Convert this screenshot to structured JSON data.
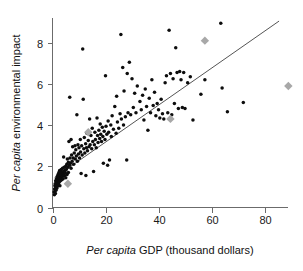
{
  "chart_data": {
    "type": "scatter",
    "title": "",
    "xlabel_italic": "Per capita",
    "xlabel_rest": " GDP (thousand dollars)",
    "ylabel_italic": "Per capita",
    "ylabel_rest": " environmental impact",
    "xlim": [
      0,
      92
    ],
    "ylim": [
      0,
      9.2
    ],
    "xticks": [
      0,
      20,
      40,
      60,
      80
    ],
    "xticklabels": [
      "0",
      "20",
      "40",
      "60",
      "80"
    ],
    "yticks": [
      0,
      2,
      4,
      6,
      8
    ],
    "yticklabels": [
      "0",
      "2",
      "4",
      "6",
      "8"
    ],
    "grid": false,
    "legend": "none",
    "series": [
      {
        "name": "countries",
        "marker": "circle",
        "color": "#0d0d0d",
        "points": [
          [
            0.6,
            0.75
          ],
          [
            0.7,
            0.62
          ],
          [
            0.8,
            0.9
          ],
          [
            0.9,
            1.05
          ],
          [
            1.0,
            0.8
          ],
          [
            1.0,
            1.15
          ],
          [
            1.1,
            0.68
          ],
          [
            1.2,
            1.3
          ],
          [
            1.2,
            0.95
          ],
          [
            1.3,
            1.1
          ],
          [
            1.4,
            1.25
          ],
          [
            1.4,
            0.85
          ],
          [
            1.5,
            1.4
          ],
          [
            1.5,
            1.0
          ],
          [
            1.6,
            1.2
          ],
          [
            1.7,
            1.35
          ],
          [
            1.7,
            0.95
          ],
          [
            1.8,
            1.5
          ],
          [
            1.8,
            1.1
          ],
          [
            1.9,
            1.25
          ],
          [
            2.0,
            1.45
          ],
          [
            2.0,
            1.05
          ],
          [
            2.1,
            1.6
          ],
          [
            2.1,
            1.2
          ],
          [
            2.2,
            1.35
          ],
          [
            2.3,
            1.5
          ],
          [
            2.3,
            1.15
          ],
          [
            2.4,
            1.7
          ],
          [
            2.4,
            1.3
          ],
          [
            2.5,
            1.45
          ],
          [
            2.6,
            1.6
          ],
          [
            2.6,
            1.25
          ],
          [
            2.7,
            1.8
          ],
          [
            2.8,
            1.4
          ],
          [
            2.8,
            1.05
          ],
          [
            2.9,
            1.55
          ],
          [
            3.0,
            1.75
          ],
          [
            3.0,
            1.3
          ],
          [
            3.1,
            1.6
          ],
          [
            3.2,
            1.45
          ],
          [
            3.3,
            1.85
          ],
          [
            3.4,
            1.55
          ],
          [
            3.5,
            1.35
          ],
          [
            3.6,
            1.7
          ],
          [
            3.7,
            1.5
          ],
          [
            3.8,
            1.9
          ],
          [
            3.9,
            1.6
          ],
          [
            4.0,
            1.4
          ],
          [
            4.1,
            1.75
          ],
          [
            4.2,
            2.45
          ],
          [
            4.3,
            1.65
          ],
          [
            4.4,
            1.95
          ],
          [
            4.5,
            1.55
          ],
          [
            4.6,
            1.8
          ],
          [
            4.8,
            1.7
          ],
          [
            5.0,
            2.0
          ],
          [
            5.0,
            1.45
          ],
          [
            5.2,
            1.85
          ],
          [
            5.4,
            2.1
          ],
          [
            5.5,
            1.6
          ],
          [
            5.6,
            2.35
          ],
          [
            5.8,
            1.95
          ],
          [
            6.0,
            2.2
          ],
          [
            6.0,
            1.7
          ],
          [
            6.2,
            3.2
          ],
          [
            6.4,
            2.05
          ],
          [
            6.5,
            5.35
          ],
          [
            6.6,
            2.4
          ],
          [
            6.8,
            2.15
          ],
          [
            7.0,
            3.3
          ],
          [
            7.0,
            1.9
          ],
          [
            7.2,
            2.55
          ],
          [
            7.4,
            2.25
          ],
          [
            7.6,
            2.95
          ],
          [
            7.8,
            2.4
          ],
          [
            8.0,
            2.1
          ],
          [
            8.2,
            2.65
          ],
          [
            8.5,
            3.0
          ],
          [
            8.6,
            2.35
          ],
          [
            8.8,
            2.8
          ],
          [
            9.0,
            2.5
          ],
          [
            9.2,
            4.5
          ],
          [
            9.4,
            2.25
          ],
          [
            9.6,
            3.05
          ],
          [
            9.8,
            2.6
          ],
          [
            10.0,
            2.9
          ],
          [
            10.2,
            2.4
          ],
          [
            10.5,
            3.3
          ],
          [
            10.6,
            2.7
          ],
          [
            10.8,
            1.65
          ],
          [
            11.0,
            3.0
          ],
          [
            11.2,
            2.55
          ],
          [
            11.4,
            7.7
          ],
          [
            11.6,
            5.25
          ],
          [
            11.8,
            2.85
          ],
          [
            12.0,
            3.4
          ],
          [
            12.2,
            2.65
          ],
          [
            12.5,
            3.1
          ],
          [
            12.6,
            1.55
          ],
          [
            12.8,
            2.9
          ],
          [
            13.0,
            3.6
          ],
          [
            13.2,
            2.75
          ],
          [
            13.5,
            3.25
          ],
          [
            13.8,
            2.95
          ],
          [
            14.0,
            4.3
          ],
          [
            14.2,
            3.05
          ],
          [
            14.5,
            3.5
          ],
          [
            14.8,
            2.85
          ],
          [
            15.0,
            3.85
          ],
          [
            15.2,
            3.2
          ],
          [
            15.5,
            1.75
          ],
          [
            15.8,
            3.05
          ],
          [
            16.0,
            3.65
          ],
          [
            16.2,
            3.3
          ],
          [
            16.5,
            2.9
          ],
          [
            16.8,
            4.35
          ],
          [
            17.0,
            3.5
          ],
          [
            17.2,
            3.15
          ],
          [
            17.5,
            3.75
          ],
          [
            17.8,
            3.35
          ],
          [
            18.0,
            4.05
          ],
          [
            18.2,
            3.55
          ],
          [
            18.5,
            3.2
          ],
          [
            18.8,
            3.9
          ],
          [
            19.0,
            3.45
          ],
          [
            19.2,
            2.15
          ],
          [
            19.5,
            3.7
          ],
          [
            19.8,
            3.3
          ],
          [
            20.0,
            6.4
          ],
          [
            20.2,
            3.95
          ],
          [
            20.5,
            3.55
          ],
          [
            20.8,
            2.05
          ],
          [
            21.0,
            4.2
          ],
          [
            21.2,
            3.65
          ],
          [
            21.5,
            2.3
          ],
          [
            22.0,
            4.0
          ],
          [
            22.2,
            3.45
          ],
          [
            22.5,
            4.45
          ],
          [
            23.0,
            3.8
          ],
          [
            23.5,
            4.9
          ],
          [
            24.0,
            3.6
          ],
          [
            24.2,
            5.4
          ],
          [
            24.5,
            4.15
          ],
          [
            25.0,
            3.85
          ],
          [
            25.5,
            4.55
          ],
          [
            25.8,
            8.4
          ],
          [
            26.0,
            4.3
          ],
          [
            26.5,
            6.8
          ],
          [
            26.8,
            4.0
          ],
          [
            27.0,
            5.65
          ],
          [
            27.5,
            4.4
          ],
          [
            28.0,
            2.3
          ],
          [
            28.2,
            6.5
          ],
          [
            28.5,
            4.6
          ],
          [
            29.0,
            7.05
          ],
          [
            29.5,
            4.5
          ],
          [
            30.0,
            6.25
          ],
          [
            30.5,
            4.85
          ],
          [
            31.0,
            5.55
          ],
          [
            31.5,
            4.6
          ],
          [
            32.0,
            5.9
          ],
          [
            33.0,
            5.15
          ],
          [
            33.5,
            4.75
          ],
          [
            34.0,
            5.45
          ],
          [
            34.5,
            4.25
          ],
          [
            35.0,
            5.75
          ],
          [
            35.5,
            4.9
          ],
          [
            36.0,
            3.75
          ],
          [
            36.5,
            5.3
          ],
          [
            37.0,
            4.6
          ],
          [
            37.5,
            6.2
          ],
          [
            38.0,
            4.95
          ],
          [
            38.5,
            5.6
          ],
          [
            39.0,
            4.45
          ],
          [
            39.5,
            5.05
          ],
          [
            40.0,
            4.75
          ],
          [
            40.5,
            4.35
          ],
          [
            41.0,
            5.25
          ],
          [
            41.5,
            4.55
          ],
          [
            42.0,
            4.3
          ],
          [
            42.5,
            6.05
          ],
          [
            43.0,
            6.4
          ],
          [
            43.5,
            4.6
          ],
          [
            44.0,
            8.6
          ],
          [
            44.5,
            6.5
          ],
          [
            45.0,
            4.5
          ],
          [
            45.5,
            6.25
          ],
          [
            46.0,
            5.05
          ],
          [
            46.5,
            7.75
          ],
          [
            47.0,
            6.55
          ],
          [
            47.5,
            4.8
          ],
          [
            48.0,
            6.6
          ],
          [
            48.5,
            6.2
          ],
          [
            49.0,
            4.85
          ],
          [
            49.5,
            6.55
          ],
          [
            50.0,
            4.8
          ],
          [
            51.0,
            6.05
          ],
          [
            52.0,
            6.35
          ],
          [
            53.0,
            4.25
          ],
          [
            56.0,
            5.5
          ],
          [
            57.5,
            6.2
          ],
          [
            63.5,
            8.95
          ],
          [
            64.0,
            5.8
          ],
          [
            66.0,
            4.65
          ],
          [
            72.0,
            5.1
          ]
        ]
      },
      {
        "name": "highlighted",
        "marker": "diamond",
        "color": "#a8a8a8",
        "points": [
          [
            5.8,
            1.15
          ],
          [
            13.5,
            3.65
          ],
          [
            44.5,
            4.3
          ],
          [
            57.5,
            8.1
          ],
          [
            89.0,
            5.9
          ]
        ]
      }
    ],
    "fit_line": {
      "x_start": 0.8,
      "y_start": 1.45,
      "x_end": 85.5,
      "y_end": 9.05,
      "color": "#555555"
    }
  }
}
